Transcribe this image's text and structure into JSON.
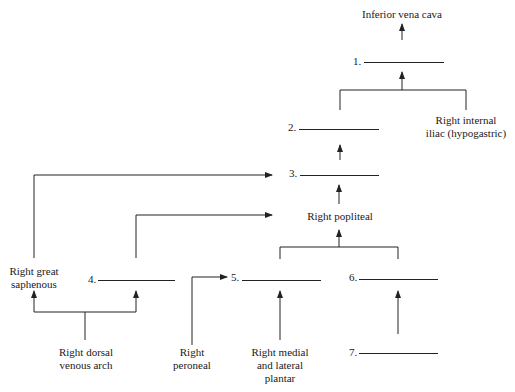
{
  "diagram": {
    "nodes": {
      "ivc": "Inferior vena cava",
      "internal_iliac_1": "Right internal",
      "internal_iliac_2": "iliac (hypogastric)",
      "popliteal": "Right popliteal",
      "great_saphenous_1": "Right great",
      "great_saphenous_2": "saphenous",
      "dorsal_arch_1": "Right dorsal",
      "dorsal_arch_2": "venous arch",
      "peroneal_1": "Right",
      "peroneal_2": "peroneal",
      "plantar_1": "Right medial",
      "plantar_2": "and lateral",
      "plantar_3": "plantar"
    },
    "blanks": [
      {
        "number": "1."
      },
      {
        "number": "2."
      },
      {
        "number": "3."
      },
      {
        "number": "4."
      },
      {
        "number": "5."
      },
      {
        "number": "6."
      },
      {
        "number": "7."
      }
    ],
    "colors": {
      "line": "#222222",
      "text": "#1a1a1a",
      "background": "#ffffff"
    }
  }
}
